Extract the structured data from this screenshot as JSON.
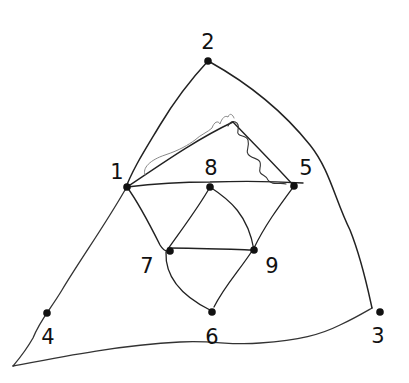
{
  "diagram": {
    "type": "hand-drawn planar graph",
    "colors": {
      "ink": "#222222",
      "scribble": "#555555",
      "scribble_light": "#888888",
      "background": "#ffffff"
    },
    "nodes": [
      {
        "id": "1",
        "label": "1",
        "x": 127,
        "y": 187,
        "label_x": 117,
        "label_y": 172
      },
      {
        "id": "2",
        "label": "2",
        "x": 208,
        "y": 61,
        "label_x": 208,
        "label_y": 42
      },
      {
        "id": "3",
        "label": "3",
        "x": 380,
        "y": 312,
        "label_x": 378,
        "label_y": 336
      },
      {
        "id": "4",
        "label": "4",
        "x": 47,
        "y": 313,
        "label_x": 48,
        "label_y": 337
      },
      {
        "id": "5",
        "label": "5",
        "x": 294,
        "y": 186,
        "label_x": 306,
        "label_y": 168
      },
      {
        "id": "6",
        "label": "6",
        "x": 212,
        "y": 312,
        "label_x": 212,
        "label_y": 337
      },
      {
        "id": "7",
        "label": "7",
        "x": 170,
        "y": 251,
        "label_x": 147,
        "label_y": 266
      },
      {
        "id": "8",
        "label": "8",
        "x": 210,
        "y": 187,
        "label_x": 211,
        "label_y": 168
      },
      {
        "id": "9",
        "label": "9",
        "x": 254,
        "y": 250,
        "label_x": 272,
        "label_y": 266
      }
    ],
    "edges": [
      [
        "1",
        "8"
      ],
      [
        "8",
        "5"
      ],
      [
        "1",
        "7"
      ],
      [
        "8",
        "7"
      ],
      [
        "8",
        "9"
      ],
      [
        "7",
        "9"
      ],
      [
        "7",
        "6"
      ],
      [
        "9",
        "6"
      ],
      [
        "5",
        "9"
      ],
      [
        "1",
        "2"
      ],
      [
        "2",
        "3"
      ]
    ]
  }
}
